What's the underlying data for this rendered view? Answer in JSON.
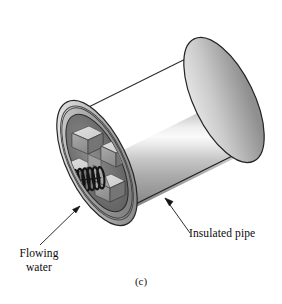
{
  "figure": {
    "caption": "(c)",
    "projection": "oblique-isometric",
    "background_color": "#ffffff"
  },
  "labels": {
    "flowing_water": {
      "line1": "Flowing",
      "line2": "water",
      "leader": "line-with-arrowhead",
      "arrow_target": "pipe-interior-lower-left"
    },
    "insulated_pipe": {
      "text": "Insulated pipe",
      "leader": "line-with-arrowhead",
      "arrow_target": "pipe-outer-surface-lower-edge"
    }
  },
  "geometry": {
    "cylinder": {
      "description": "insulated pipe body shown as a shaded tube receding to upper right",
      "near_end_center_x": 97,
      "near_end_center_y": 163,
      "far_end_center_x": 224,
      "far_end_center_y": 100,
      "radius_x": 30,
      "radius_y": 68,
      "rotation_deg": -26
    },
    "rings": [
      {
        "name": "outer-pipe-wall",
        "fill": "#b4b4b4"
      },
      {
        "name": "insulation-annulus",
        "fill": "#8c8c8c"
      },
      {
        "name": "inner-bore-shadow",
        "fill": "#6e6e6e"
      }
    ],
    "fins": {
      "shape": "plus-cross-extruded-blocks",
      "count": 4,
      "top_face_color": "#d6d6d6",
      "side_face_color": "#a6a6a6",
      "recess_color": "#6f6f6f"
    },
    "spring": {
      "name": "coil-spring-turbulator",
      "color": "#1a1a1a",
      "turns": 10,
      "orientation": "horizontal-slightly-tilted"
    }
  },
  "colors": {
    "metal_light": "#f2f2f2",
    "metal_mid": "#c0c0c0",
    "metal_dark": "#8a8a8a",
    "metal_shadow": "#6a6a6a",
    "outline": "#2b2b2b",
    "spring_dark": "#141414",
    "label_text": "#0a0a0a"
  }
}
